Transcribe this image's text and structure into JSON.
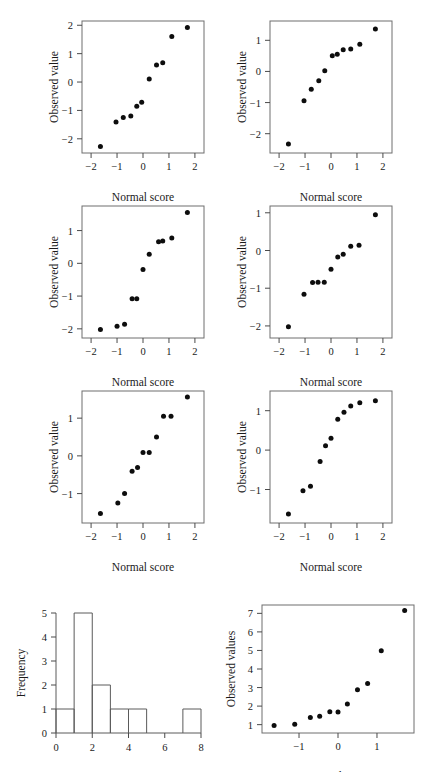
{
  "figure": {
    "background": "#ffffff",
    "dot_color": "#0d0d0d",
    "frame_color": "#6e6e6e"
  },
  "labels": {
    "normal_score": "Normal score",
    "observed_value": "Observed value",
    "observed_values": "Observed values",
    "frequency": "Frequency"
  },
  "chart_data": [
    {
      "id": "qq-1",
      "type": "scatter",
      "title": "",
      "xlabel": "Normal score",
      "ylabel": "Observed value",
      "xlim": [
        -2.35,
        2.35
      ],
      "ylim": [
        -2.5,
        2.15
      ],
      "xticks": [
        -2,
        -1,
        0,
        1,
        2
      ],
      "xticklabels": [
        "−2",
        "−1",
        "0",
        "1",
        "2"
      ],
      "yticks": [
        -2,
        -1,
        0,
        1,
        2
      ],
      "yticklabels": [
        "−2",
        "−1",
        "0",
        "1",
        "2"
      ],
      "grid": false,
      "legend": "none",
      "x": [
        -1.64,
        -1.04,
        -0.76,
        -0.47,
        -0.24,
        -0.05,
        0.24,
        0.52,
        0.76,
        1.11,
        1.71
      ],
      "y": [
        -2.27,
        -1.41,
        -1.25,
        -1.2,
        -0.85,
        -0.71,
        0.11,
        0.6,
        0.68,
        1.6,
        1.92
      ]
    },
    {
      "id": "qq-2",
      "type": "scatter",
      "title": "",
      "xlabel": "Normal score",
      "ylabel": "Observed value",
      "xlim": [
        -2.35,
        2.35
      ],
      "ylim": [
        -2.62,
        1.62
      ],
      "xticks": [
        -2,
        -1,
        0,
        1,
        2
      ],
      "xticklabels": [
        "−2",
        "−1",
        "0",
        "1",
        "2"
      ],
      "yticks": [
        -2,
        -1,
        0,
        1
      ],
      "yticklabels": [
        "−2",
        "−1",
        "0",
        "1"
      ],
      "grid": false,
      "legend": "none",
      "x": [
        -1.64,
        -1.04,
        -0.76,
        -0.47,
        -0.24,
        0.05,
        0.24,
        0.47,
        0.76,
        1.11,
        1.71
      ],
      "y": [
        -2.33,
        -0.94,
        -0.57,
        -0.3,
        0.02,
        0.5,
        0.55,
        0.7,
        0.72,
        0.87,
        1.36
      ]
    },
    {
      "id": "qq-3",
      "type": "scatter",
      "title": "",
      "xlabel": "Normal score",
      "ylabel": "Observed value",
      "xlim": [
        -2.35,
        2.35
      ],
      "ylim": [
        -2.28,
        1.75
      ],
      "xticks": [
        -2,
        -1,
        0,
        1,
        2
      ],
      "xticklabels": [
        "−2",
        "−1",
        "0",
        "1",
        "2"
      ],
      "yticks": [
        -2,
        -1,
        0,
        1
      ],
      "yticklabels": [
        "−2",
        "−1",
        "0",
        "1"
      ],
      "grid": false,
      "legend": "none",
      "x": [
        -1.64,
        -1.0,
        -0.71,
        -0.42,
        -0.24,
        0.0,
        0.24,
        0.6,
        0.76,
        1.11,
        1.71
      ],
      "y": [
        -2.02,
        -1.92,
        -1.86,
        -1.08,
        -1.08,
        -0.19,
        0.28,
        0.66,
        0.68,
        0.77,
        1.55
      ]
    },
    {
      "id": "qq-4",
      "type": "scatter",
      "title": "",
      "xlabel": "Normal score",
      "ylabel": "Observed value",
      "xlim": [
        -2.35,
        2.35
      ],
      "ylim": [
        -2.32,
        1.18
      ],
      "xticks": [
        -2,
        -1,
        0,
        1,
        2
      ],
      "xticklabels": [
        "−2",
        "−1",
        "0",
        "1",
        "2"
      ],
      "yticks": [
        -2,
        -1,
        0,
        1
      ],
      "yticklabels": [
        "−2",
        "−1",
        "0",
        "1"
      ],
      "grid": false,
      "legend": "none",
      "x": [
        -1.64,
        -1.04,
        -0.71,
        -0.5,
        -0.26,
        0.0,
        0.26,
        0.47,
        0.76,
        1.08,
        1.71
      ],
      "y": [
        -2.02,
        -1.16,
        -0.85,
        -0.84,
        -0.84,
        -0.5,
        -0.17,
        -0.1,
        0.11,
        0.14,
        0.95
      ]
    },
    {
      "id": "qq-5",
      "type": "scatter",
      "title": "",
      "xlabel": "Normal score",
      "ylabel": "Observed value",
      "xlim": [
        -2.35,
        2.35
      ],
      "ylim": [
        -1.78,
        1.72
      ],
      "xticks": [
        -2,
        -1,
        0,
        1,
        2
      ],
      "xticklabels": [
        "−2",
        "−1",
        "0",
        "1",
        "2"
      ],
      "yticks": [
        -1,
        0,
        1
      ],
      "yticklabels": [
        "−1",
        "0",
        "1"
      ],
      "grid": false,
      "legend": "none",
      "x": [
        -1.64,
        -0.97,
        -0.71,
        -0.42,
        -0.21,
        0.0,
        0.24,
        0.52,
        0.79,
        1.08,
        1.71
      ],
      "y": [
        -1.53,
        -1.25,
        -1.0,
        -0.41,
        -0.31,
        0.09,
        0.09,
        0.5,
        1.05,
        1.05,
        1.56
      ]
    },
    {
      "id": "qq-6",
      "type": "scatter",
      "title": "",
      "xlabel": "Normal score",
      "ylabel": "Observed value",
      "xlim": [
        -2.35,
        2.35
      ],
      "ylim": [
        -1.85,
        1.5
      ],
      "xticks": [
        -2,
        -1,
        0,
        1,
        2
      ],
      "xticklabels": [
        "−2",
        "−1",
        "0",
        "1",
        "2"
      ],
      "yticks": [
        -1,
        0,
        1
      ],
      "yticklabels": [
        "−1",
        "0",
        "1"
      ],
      "grid": false,
      "legend": "none",
      "x": [
        -1.64,
        -1.08,
        -0.79,
        -0.42,
        -0.21,
        0.0,
        0.26,
        0.5,
        0.76,
        1.11,
        1.71
      ],
      "y": [
        -1.62,
        -1.03,
        -0.92,
        -0.29,
        0.11,
        0.3,
        0.78,
        0.96,
        1.12,
        1.2,
        1.25
      ]
    },
    {
      "id": "histogram",
      "type": "bar",
      "title": "",
      "xlabel": "",
      "ylabel": "Frequency",
      "xlim": [
        0,
        8
      ],
      "ylim": [
        0,
        5
      ],
      "xticks": [
        0,
        2,
        4,
        6,
        8
      ],
      "xticklabels": [
        "0",
        "2",
        "4",
        "6",
        "8"
      ],
      "yticks": [
        0,
        1,
        2,
        3,
        4,
        5
      ],
      "yticklabels": [
        "0",
        "1",
        "2",
        "3",
        "4",
        "5"
      ],
      "grid": false,
      "legend": "none",
      "bin_edges": [
        0,
        1,
        2,
        3,
        4,
        5,
        6,
        7,
        8
      ],
      "categories": [
        "0-1",
        "1-2",
        "2-3",
        "3-4",
        "4-5",
        "5-6",
        "6-7",
        "7-8"
      ],
      "values": [
        1,
        5,
        2,
        1,
        1,
        0,
        0,
        1
      ]
    },
    {
      "id": "qq-observed-values",
      "type": "scatter",
      "title": "",
      "xlabel": "Normal score",
      "ylabel": "Observed values",
      "xlim": [
        -1.95,
        1.95
      ],
      "ylim": [
        0.55,
        7.45
      ],
      "xticks": [
        -1,
        0,
        1
      ],
      "xticklabels": [
        "−1",
        "0",
        "1"
      ],
      "yticks": [
        1,
        2,
        3,
        4,
        5,
        6,
        7
      ],
      "yticklabels": [
        "1",
        "2",
        "3",
        "4",
        "5",
        "6",
        "7"
      ],
      "grid": false,
      "legend": "none",
      "x": [
        -1.64,
        -1.11,
        -0.71,
        -0.47,
        -0.21,
        0.0,
        0.24,
        0.5,
        0.76,
        1.11,
        1.71
      ],
      "y": [
        0.95,
        1.02,
        1.38,
        1.45,
        1.7,
        1.68,
        2.12,
        2.88,
        3.22,
        4.98,
        7.15
      ]
    }
  ]
}
